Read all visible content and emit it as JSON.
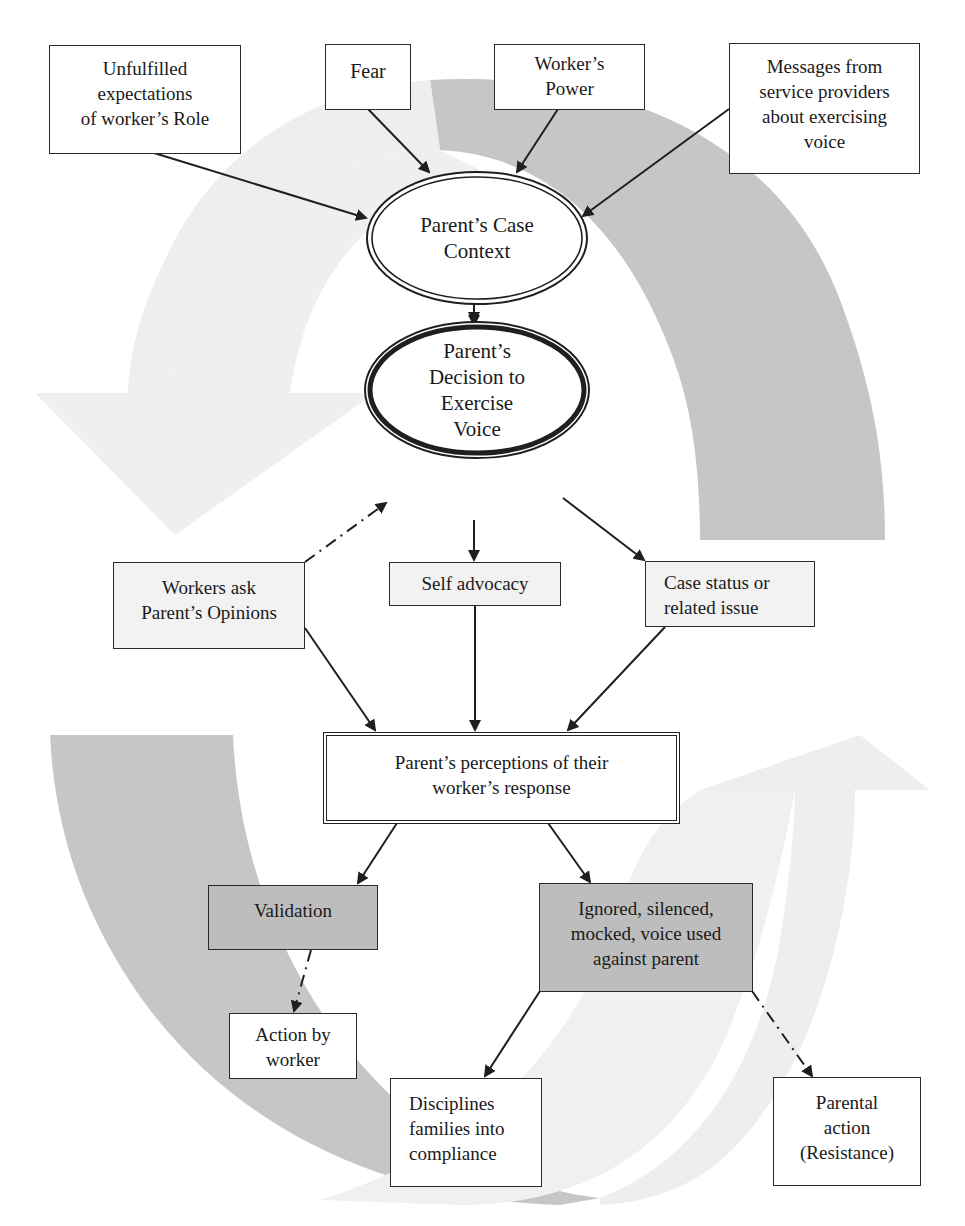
{
  "diagram": {
    "type": "flow-cycle",
    "colors": {
      "node_border": "#2a2a2a",
      "shaded_fill": "#bdbdbd",
      "light_fill": "#f2f2f2",
      "background_arrow_dark": "#c8c8c8",
      "background_arrow_light": "#efefef"
    },
    "inputs": {
      "unfulfilled": "Unfulfilled\nexpectations\nof worker’s Role",
      "fear": "Fear",
      "workers_power": "Worker’s\nPower",
      "messages": "Messages from\nservice providers\nabout exercising\nvoice"
    },
    "case_context": "Parent’s Case\nContext",
    "decision": "Parent’s\nDecision to\nExercise\nVoice",
    "triggers": {
      "workers_ask": "Workers ask\nParent’s Opinions",
      "self_advocacy": "Self advocacy",
      "case_status": "Case status or\nrelated issue"
    },
    "perceptions": "Parent’s perceptions of their\nworker’s response",
    "responses": {
      "validation": "Validation",
      "ignored": "Ignored, silenced,\nmocked, voice used\nagainst parent"
    },
    "outcomes": {
      "action_by_worker": "Action by\nworker",
      "disciplines": "Disciplines\nfamilies into\ncompliance",
      "parental_action": "Parental\naction\n(Resistance)"
    },
    "edges": [
      {
        "from": "unfulfilled",
        "to": "case_context",
        "style": "solid"
      },
      {
        "from": "fear",
        "to": "case_context",
        "style": "solid"
      },
      {
        "from": "workers_power",
        "to": "case_context",
        "style": "solid"
      },
      {
        "from": "messages",
        "to": "case_context",
        "style": "solid"
      },
      {
        "from": "case_context",
        "to": "decision",
        "style": "solid"
      },
      {
        "from": "workers_ask",
        "to": "decision",
        "style": "dash-dot"
      },
      {
        "from": "decision",
        "to": "self_advocacy",
        "style": "solid"
      },
      {
        "from": "decision",
        "to": "case_status",
        "style": "solid"
      },
      {
        "from": "workers_ask",
        "to": "perceptions",
        "style": "solid"
      },
      {
        "from": "self_advocacy",
        "to": "perceptions",
        "style": "solid"
      },
      {
        "from": "case_status",
        "to": "perceptions",
        "style": "solid"
      },
      {
        "from": "perceptions",
        "to": "validation",
        "style": "solid"
      },
      {
        "from": "perceptions",
        "to": "ignored",
        "style": "solid"
      },
      {
        "from": "validation",
        "to": "action_by_worker",
        "style": "dash-dot"
      },
      {
        "from": "ignored",
        "to": "disciplines",
        "style": "solid"
      },
      {
        "from": "ignored",
        "to": "parental_action",
        "style": "dash-dot"
      }
    ]
  }
}
